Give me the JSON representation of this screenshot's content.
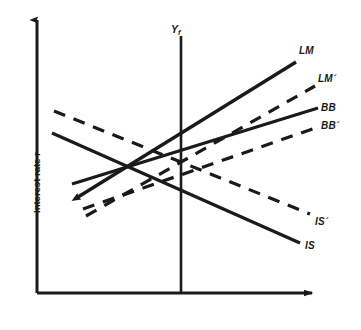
{
  "figure": {
    "title": "",
    "background_color": "#ffffff",
    "ink_color": "#1a1a1a"
  },
  "axes": {
    "y_axis_label": "Interest rate r",
    "x_axis_label": "",
    "x_axis": {
      "x_start": 37,
      "x_end": 318,
      "y": 293,
      "arrow": true
    },
    "y_axis": {
      "y_start": 293,
      "y_end": 14,
      "x": 37,
      "arrow": true
    }
  },
  "vertical_line": {
    "label_text": "Y",
    "label_sub": "f",
    "name": "full-employment-output",
    "x": 181,
    "y_top": 34,
    "y_bottom": 293
  },
  "chart_data": {
    "type": "line",
    "title": "",
    "xlabel": "",
    "ylabel": "Interest rate r",
    "grid": false,
    "legend": "inline-end-labels",
    "series": [
      {
        "name": "LM",
        "label": "LM",
        "style": "solid",
        "slope": "positive",
        "points": [
          [
            78,
            197
          ],
          [
            296,
            62
          ]
        ],
        "label_x": 299,
        "label_y": 46
      },
      {
        "name": "LM_prime",
        "label": "LM´",
        "style": "dashed",
        "slope": "positive",
        "points": [
          [
            86,
            216
          ],
          [
            315,
            86
          ]
        ],
        "label_x": 318,
        "label_y": 74
      },
      {
        "name": "BB",
        "label": "BB",
        "style": "solid",
        "slope": "positive",
        "points": [
          [
            72,
            184
          ],
          [
            318,
            108
          ]
        ],
        "label_x": 321,
        "label_y": 103
      },
      {
        "name": "BB_prime",
        "label": "BB´",
        "style": "dashed",
        "slope": "positive",
        "points": [
          [
            83,
            209
          ],
          [
            318,
            127
          ]
        ],
        "label_x": 321,
        "label_y": 121
      },
      {
        "name": "IS",
        "label": "IS",
        "style": "solid",
        "slope": "negative",
        "points": [
          [
            52,
            133
          ],
          [
            300,
            243
          ]
        ],
        "label_x": 305,
        "label_y": 241
      },
      {
        "name": "IS_prime",
        "label": "IS´",
        "style": "dashed",
        "slope": "negative",
        "points": [
          [
            54,
            111
          ],
          [
            310,
            214
          ]
        ],
        "label_x": 315,
        "label_y": 217
      }
    ]
  }
}
